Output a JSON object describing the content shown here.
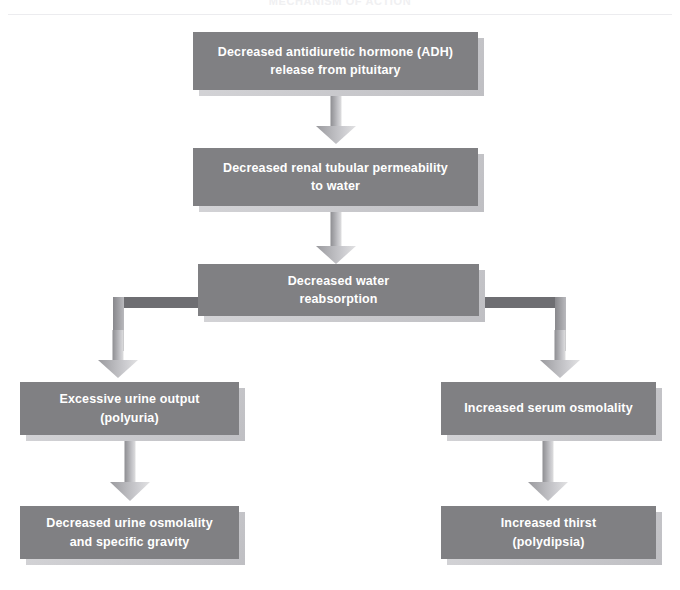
{
  "header": {
    "title": "MECHANISM OF ACTION"
  },
  "diagram": {
    "type": "flowchart",
    "orientation": "top-down",
    "box_fill_color": "#808083",
    "box_text_color": "#ffffff",
    "arrow_color": "#b4b4b8",
    "connector_color": "#6e6e72",
    "nodes": [
      {
        "id": "adh",
        "label": "Decreased antidiuretic hormone (ADH)\nrelease from pituitary",
        "line1": "Decreased antidiuretic hormone (ADH)",
        "line2": "release from pituitary"
      },
      {
        "id": "permeability",
        "label": "Decreased renal tubular permeability\nto water",
        "line1": "Decreased renal tubular permeability",
        "line2": "to water"
      },
      {
        "id": "reabsorption",
        "label": "Decreased water\nreabsorption",
        "line1": "Decreased water",
        "line2": "reabsorption"
      },
      {
        "id": "polyuria",
        "label": "Excessive urine output\n(polyuria)",
        "line1": "Excessive urine output",
        "line2": "(polyuria)"
      },
      {
        "id": "serum-osmolality",
        "label": "Increased serum osmolality",
        "line1": "Increased serum osmolality",
        "line2": ""
      },
      {
        "id": "urine-osmolality",
        "label": "Decreased urine osmolality\nand specific gravity",
        "line1": "Decreased urine osmolality",
        "line2": "and specific gravity"
      },
      {
        "id": "thirst",
        "label": "Increased thirst\n(polydipsia)",
        "line1": "Increased thirst",
        "line2": "(polydipsia)"
      }
    ],
    "edges": [
      {
        "from": "adh",
        "to": "permeability",
        "style": "straight-down-arrow"
      },
      {
        "from": "permeability",
        "to": "reabsorption",
        "style": "straight-down-arrow"
      },
      {
        "from": "reabsorption",
        "to": "polyuria",
        "style": "elbow-left-down-arrow"
      },
      {
        "from": "reabsorption",
        "to": "serum-osmolality",
        "style": "elbow-right-down-arrow"
      },
      {
        "from": "polyuria",
        "to": "urine-osmolality",
        "style": "straight-down-arrow"
      },
      {
        "from": "serum-osmolality",
        "to": "thirst",
        "style": "straight-down-arrow"
      }
    ]
  }
}
